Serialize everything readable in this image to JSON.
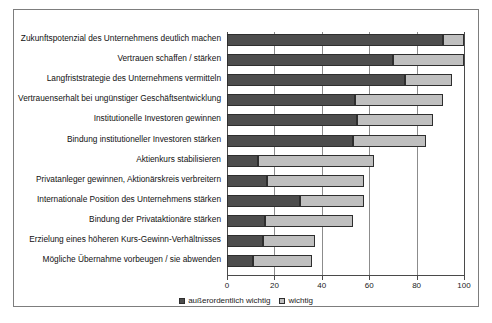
{
  "chart_data": {
    "type": "bar",
    "orientation": "horizontal",
    "stacked": true,
    "title": "",
    "subtitle": "",
    "xlabel": "",
    "ylabel": "",
    "xlim": [
      0,
      100
    ],
    "xticks": [
      0,
      20,
      40,
      60,
      80,
      100
    ],
    "xticklabels": [
      "0",
      "20",
      "40",
      "60",
      "80",
      "100"
    ],
    "grid": true,
    "grid_axis": "x",
    "legend_position": "bottom-center",
    "colors": {
      "series_0": "#4d4d4d",
      "series_1": "#bfbfbf",
      "bar_border": "#2e2e2e",
      "frame": "#7d7d7d",
      "grid": "#8c8c8c",
      "background": "#ffffff",
      "text": "#111111"
    },
    "categories": [
      "Zukunftspotenzial des Unternehmens deutlich machen",
      "Vertrauen schaffen / stärken",
      "Langfriststrategie des Unternehmens vermitteln",
      "Vertrauenserhalt bei ungünstiger Geschäftsentwicklung",
      "Institutionelle Investoren gewinnen",
      "Bindung institutioneller Investoren stärken",
      "Aktienkurs stabilisieren",
      "Privatanleger gewinnen, Aktionärskreis verbreitern",
      "Internationale Position des Unternehmens stärken",
      "Bindung der Privataktionäre stärken",
      "Erzielung eines höheren Kurs-Gewinn-Verhältnisses",
      "Mögliche Übernahme vorbeugen / sie abwenden"
    ],
    "series": [
      {
        "name": "außerordentlich wichtig",
        "color": "#4d4d4d",
        "values": [
          91,
          70,
          75,
          54,
          55,
          53,
          13,
          17,
          31,
          16,
          15,
          11
        ]
      },
      {
        "name": "wichtig",
        "color": "#bfbfbf",
        "values": [
          9,
          30,
          20,
          37,
          32,
          31,
          49,
          41,
          27,
          37,
          22,
          25
        ]
      }
    ],
    "totals": [
      100,
      100,
      95,
      91,
      87,
      84,
      62,
      58,
      58,
      53,
      37,
      36
    ]
  },
  "legend": {
    "items": [
      {
        "label": "außerordentlich wichtig",
        "swatch": "series_0"
      },
      {
        "label": "wichtig",
        "swatch": "series_1"
      }
    ]
  }
}
